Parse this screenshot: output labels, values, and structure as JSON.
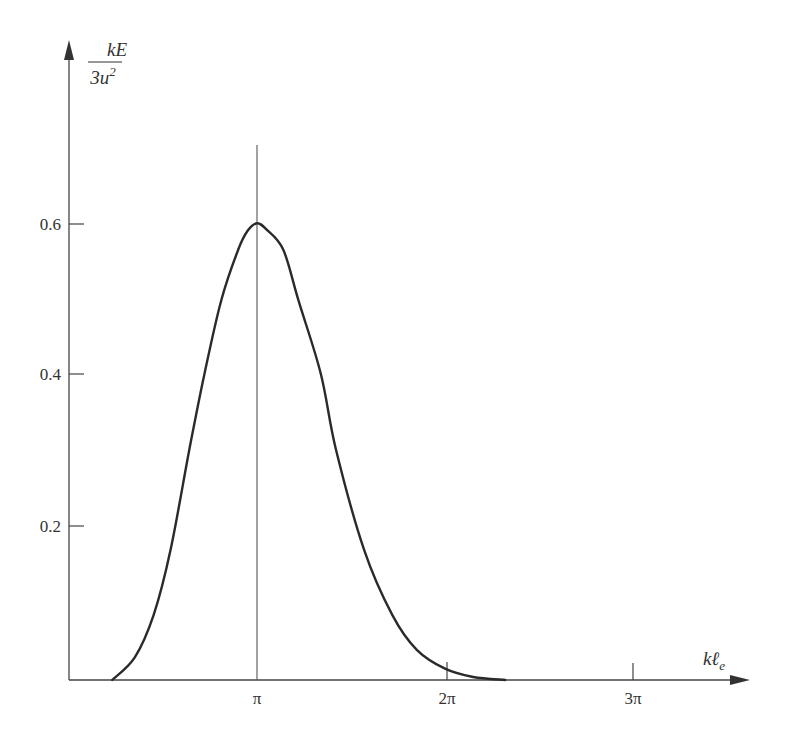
{
  "chart_data": {
    "type": "line",
    "title": "",
    "xlabel": "kℓ_e",
    "ylabel": "kE / 3u²",
    "ylabel_parts": {
      "numerator": "kE",
      "denominator": "3u",
      "denominator_sup": "2"
    },
    "xlabel_parts": {
      "main": "kℓ",
      "sub": "e"
    },
    "x_unit": "π",
    "xlim": [
      0,
      3.6
    ],
    "ylim": [
      0,
      0.85
    ],
    "grid": false,
    "legend": null,
    "x_ticks": [
      {
        "value": 1,
        "label": "π"
      },
      {
        "value": 2,
        "label": "2π"
      },
      {
        "value": 3,
        "label": "3π"
      }
    ],
    "y_ticks": [
      {
        "value": 0.2,
        "label": "0.2"
      },
      {
        "value": 0.4,
        "label": "0.4"
      },
      {
        "value": 0.6,
        "label": "0.6"
      }
    ],
    "reference_lines": [
      {
        "orientation": "vertical",
        "x": 1,
        "note": "vertical line at x = π through peak"
      }
    ],
    "series": [
      {
        "name": "kE/3u²",
        "x_in_pi_units": [
          0.23,
          0.35,
          0.45,
          0.54,
          0.64,
          0.72,
          0.81,
          0.9,
          0.95,
          1.0,
          1.05,
          1.14,
          1.22,
          1.34,
          1.42,
          1.57,
          1.72,
          1.85,
          2.0,
          2.15,
          2.32
        ],
        "values": [
          0.0,
          0.03,
          0.086,
          0.172,
          0.305,
          0.405,
          0.503,
          0.57,
          0.595,
          0.605,
          0.597,
          0.57,
          0.503,
          0.405,
          0.305,
          0.172,
          0.086,
          0.04,
          0.015,
          0.004,
          0.0
        ]
      }
    ]
  }
}
